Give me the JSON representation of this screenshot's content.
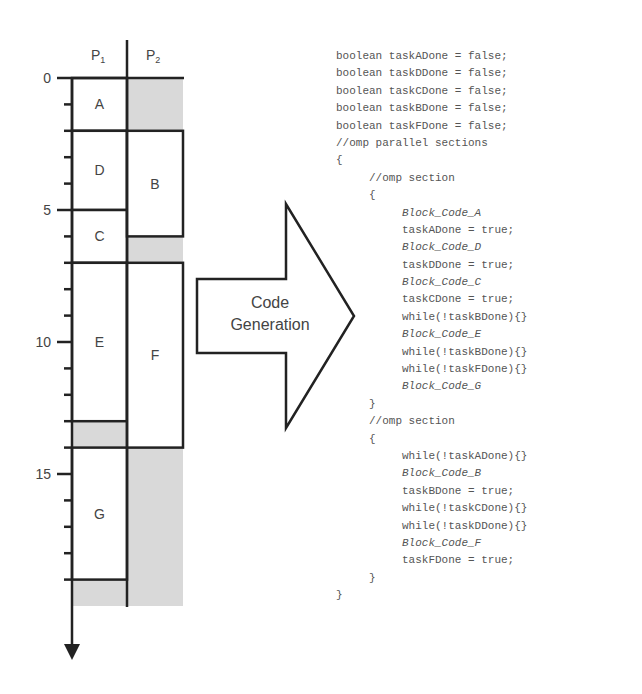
{
  "schedule": {
    "processors": [
      "P",
      "P"
    ],
    "processor_subscripts": [
      "1",
      "2"
    ],
    "axis": {
      "ticks": [
        0,
        5,
        10,
        15
      ],
      "tick_labels": [
        "0",
        "5",
        "10",
        "15"
      ],
      "min": 0,
      "max": 20,
      "minor_step": 1
    },
    "tasks": [
      {
        "label": "A",
        "processor": 1,
        "start": 0,
        "end": 2
      },
      {
        "label": "D",
        "processor": 1,
        "start": 2,
        "end": 5
      },
      {
        "label": "C",
        "processor": 1,
        "start": 5,
        "end": 7
      },
      {
        "label": "E",
        "processor": 1,
        "start": 7,
        "end": 13
      },
      {
        "label": "G",
        "processor": 1,
        "start": 14,
        "end": 19
      },
      {
        "label": "B",
        "processor": 2,
        "start": 2,
        "end": 6
      },
      {
        "label": "F",
        "processor": 2,
        "start": 7,
        "end": 14
      }
    ],
    "idle": [
      {
        "processor": 2,
        "start": 0,
        "end": 2
      },
      {
        "processor": 2,
        "start": 6,
        "end": 7
      },
      {
        "processor": 1,
        "start": 13,
        "end": 14
      },
      {
        "processor": 2,
        "start": 14,
        "end": 20
      },
      {
        "processor": 1,
        "start": 19,
        "end": 20
      }
    ],
    "idle_color": "#d9d9d9"
  },
  "arrow": {
    "line1": "Code",
    "line2": "Generation"
  },
  "code": {
    "lines": [
      {
        "indent": 0,
        "text": "boolean taskADone = false;",
        "italic": false
      },
      {
        "indent": 0,
        "text": "boolean taskDDone = false;",
        "italic": false
      },
      {
        "indent": 0,
        "text": "boolean taskCDone = false;",
        "italic": false
      },
      {
        "indent": 0,
        "text": "boolean taskBDone = false;",
        "italic": false
      },
      {
        "indent": 0,
        "text": "boolean taskFDone = false;",
        "italic": false
      },
      {
        "indent": 0,
        "text": "//omp parallel sections",
        "italic": false
      },
      {
        "indent": 0,
        "text": "{",
        "italic": false
      },
      {
        "indent": 1,
        "text": "//omp section",
        "italic": false
      },
      {
        "indent": 1,
        "text": "{",
        "italic": false
      },
      {
        "indent": 2,
        "text": "Block_Code_A",
        "italic": true
      },
      {
        "indent": 2,
        "text": "taskADone = true;",
        "italic": false
      },
      {
        "indent": 2,
        "text": "Block_Code_D",
        "italic": true
      },
      {
        "indent": 2,
        "text": "taskDDone = true;",
        "italic": false
      },
      {
        "indent": 2,
        "text": "Block_Code_C",
        "italic": true
      },
      {
        "indent": 2,
        "text": "taskCDone = true;",
        "italic": false
      },
      {
        "indent": 2,
        "text": "while(!taskBDone){}",
        "italic": false
      },
      {
        "indent": 2,
        "text": "Block_Code_E",
        "italic": true
      },
      {
        "indent": 2,
        "text": "while(!taskBDone){}",
        "italic": false
      },
      {
        "indent": 2,
        "text": "while(!taskFDone){}",
        "italic": false
      },
      {
        "indent": 2,
        "text": "Block_Code_G",
        "italic": true
      },
      {
        "indent": 1,
        "text": "}",
        "italic": false
      },
      {
        "indent": 1,
        "text": "//omp section",
        "italic": false
      },
      {
        "indent": 1,
        "text": "{",
        "italic": false
      },
      {
        "indent": 2,
        "text": "while(!taskADone){}",
        "italic": false
      },
      {
        "indent": 2,
        "text": "Block_Code_B",
        "italic": true
      },
      {
        "indent": 2,
        "text": "taskBDone = true;",
        "italic": false
      },
      {
        "indent": 2,
        "text": "while(!taskCDone){}",
        "italic": false
      },
      {
        "indent": 2,
        "text": "while(!taskDDone){}",
        "italic": false
      },
      {
        "indent": 2,
        "text": "Block_Code_F",
        "italic": true
      },
      {
        "indent": 2,
        "text": "taskFDone = true;",
        "italic": false
      },
      {
        "indent": 1,
        "text": "}",
        "italic": false
      },
      {
        "indent": 0,
        "text": "}",
        "italic": false
      }
    ]
  }
}
